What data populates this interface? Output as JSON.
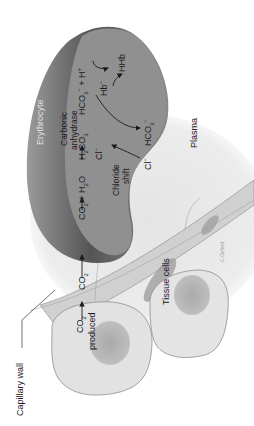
{
  "diagram": {
    "orientation": "rotated 90 degrees counter-clockwise",
    "structures": {
      "erythrocyte": "Erythrocyte",
      "plasma": "Plasma",
      "tissue_cells": "Tissue cells",
      "capillary_wall": "Capillary wall"
    },
    "labels": {
      "co2_produced_1": "CO",
      "co2_produced_sub": "2",
      "co2_produced_2": "produced",
      "co2_wall": "CO",
      "co2_wall_sub": "2",
      "co2_rbc": "CO",
      "co2_rbc_sub": "2",
      "plus_h2o": " + H",
      "h2o_sub": "2",
      "h2o_o": "O",
      "enzyme_1": "Carbonic",
      "enzyme_2": "anhydrase",
      "h2co3_h": "H",
      "h2co3_sub1": "2",
      "h2co3_co": "CO",
      "h2co3_sub2": "3",
      "hco3": "HCO",
      "hco3_sub": "3",
      "hco3_sup": "−",
      "plus_h": " + H",
      "h_sup": "+",
      "hb": "Hb",
      "hb_sup": "−",
      "hhb": "HHb",
      "cl_in": "Cl",
      "cl_in_sup": "−",
      "chloride_shift_1": "Chloride",
      "chloride_shift_2": "shift",
      "cl_out": "Cl",
      "cl_out_sup": "−",
      "hco3_out": "HCO",
      "hco3_out_sub": "3",
      "hco3_out_sup": "−",
      "signature": "C.Oxford"
    },
    "colors": {
      "erythrocyte": "#8f8f8f",
      "erythrocyte_shadow": "#5e5e5e",
      "plasma": "#e6e6e6",
      "capillary_wall": "#d4d4d4",
      "tissue_cell": "#e2e2e2",
      "nucleus": "#a9a9a9",
      "text": "#1a1a1a"
    }
  }
}
